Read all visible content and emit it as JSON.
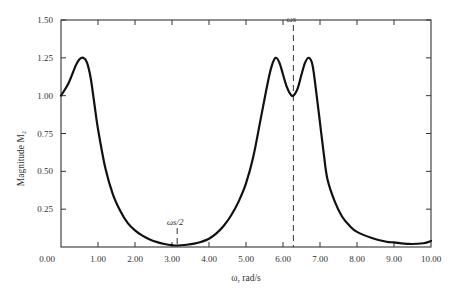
{
  "chart_data": {
    "type": "line",
    "title": "",
    "xlabel": "ω, rad/s",
    "ylabel": "Magnitude M₂",
    "xlim": [
      0,
      10
    ],
    "ylim": [
      0,
      1.5
    ],
    "grid": false,
    "legend": null,
    "x_ticks": [
      "0.00",
      "1.00",
      "2.00",
      "3.00",
      "4.00",
      "5.00",
      "6.00",
      "7.00",
      "8.00",
      "9.00",
      "10.00"
    ],
    "y_ticks": [
      "0.25",
      "0.50",
      "0.75",
      "1.00",
      "1.25",
      "1.50"
    ],
    "series": [
      {
        "name": "M2",
        "x": [
          0.0,
          0.2,
          0.4,
          0.5,
          0.6,
          0.7,
          0.8,
          0.9,
          1.0,
          1.2,
          1.4,
          1.6,
          1.8,
          2.0,
          2.2,
          2.4,
          2.6,
          2.8,
          3.0,
          3.14,
          3.4,
          3.6,
          3.8,
          4.0,
          4.2,
          4.4,
          4.6,
          4.8,
          5.0,
          5.2,
          5.4,
          5.6,
          5.7,
          5.8,
          5.9,
          6.0,
          6.1,
          6.2,
          6.28,
          6.4,
          6.5,
          6.6,
          6.7,
          6.8,
          6.9,
          7.0,
          7.1,
          7.2,
          7.4,
          7.6,
          7.8,
          8.0,
          8.4,
          8.8,
          9.0,
          9.4,
          9.8,
          10.0
        ],
        "values": [
          1.0,
          1.08,
          1.2,
          1.24,
          1.25,
          1.22,
          1.12,
          0.95,
          0.78,
          0.52,
          0.35,
          0.24,
          0.16,
          0.11,
          0.075,
          0.05,
          0.032,
          0.02,
          0.012,
          0.01,
          0.015,
          0.022,
          0.035,
          0.055,
          0.09,
          0.14,
          0.21,
          0.3,
          0.42,
          0.6,
          0.85,
          1.1,
          1.2,
          1.25,
          1.22,
          1.14,
          1.06,
          1.01,
          1.0,
          1.05,
          1.14,
          1.22,
          1.25,
          1.2,
          1.02,
          0.82,
          0.62,
          0.45,
          0.3,
          0.2,
          0.14,
          0.1,
          0.06,
          0.035,
          0.03,
          0.02,
          0.025,
          0.04
        ]
      }
    ],
    "annotations": [
      {
        "label": "ωs/2",
        "x": 3.14,
        "style": "dashed-vertical"
      },
      {
        "label": "ωs",
        "x": 6.28,
        "style": "dashed-vertical"
      }
    ]
  }
}
